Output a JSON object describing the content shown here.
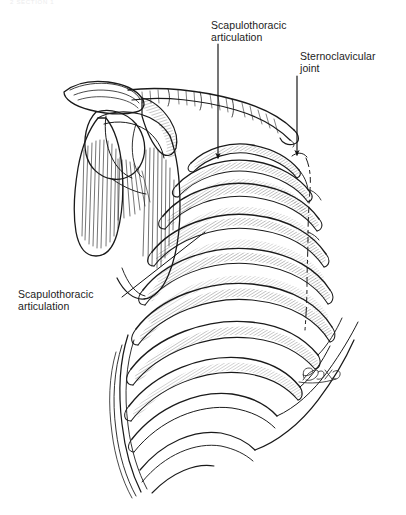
{
  "figure": {
    "running_head": "2     SECTION 1",
    "background_color": "#ffffff",
    "ink_color": "#1a1a1a",
    "label_color": "#1c1c1c",
    "width": 406,
    "height": 515
  },
  "annotations": [
    {
      "id": "scapulothoracic-top",
      "line1": "Scapulothoracic",
      "line2": "articulation",
      "leader": "vertical-arrow-down"
    },
    {
      "id": "sternoclavicular",
      "line1": "Sternoclavicular",
      "line2": "joint",
      "leader": "vertical-arrow-down"
    },
    {
      "id": "scapulothoracic-left",
      "line1": "Scapulothoracic",
      "line2": "articulation",
      "leader": "diagonal-line"
    }
  ],
  "signature": {
    "text": "Box",
    "present": true
  },
  "structures": [
    "clavicle",
    "acromion",
    "scapula",
    "glenoid",
    "humeral-head",
    "ribs",
    "sternum",
    "costal-cartilage"
  ]
}
